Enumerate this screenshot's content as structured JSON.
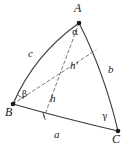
{
  "figure": {
    "name": "spherical-triangle",
    "stroke_color": "#3c3c3c",
    "dash_color": "#6b6b6b",
    "background": "#ffffff"
  },
  "vertices": [
    {
      "id": "A",
      "label": "A",
      "x": 79,
      "y": 23,
      "label_x": 76,
      "label_y": 4
    },
    {
      "id": "B",
      "label": "B",
      "x": 13,
      "y": 104,
      "label_x": 7,
      "label_y": 107
    },
    {
      "id": "C",
      "label": "C",
      "x": 118,
      "y": 131,
      "label_x": 114,
      "label_y": 134
    }
  ],
  "angles": [
    {
      "id": "alpha",
      "label": "α",
      "at": "A",
      "x": 74,
      "y": 30
    },
    {
      "id": "beta",
      "label": "β",
      "at": "B",
      "x": 22,
      "y": 92
    },
    {
      "id": "gamma",
      "label": "γ",
      "at": "C",
      "x": 104,
      "y": 114
    }
  ],
  "sides": [
    {
      "id": "a",
      "label": "a",
      "opposite": "A",
      "from": "B",
      "to": "C",
      "x": 57,
      "y": 131
    },
    {
      "id": "b",
      "label": "b",
      "opposite": "B",
      "from": "A",
      "to": "C",
      "x": 111,
      "y": 69
    },
    {
      "id": "c",
      "label": "c",
      "opposite": "C",
      "from": "B",
      "to": "A",
      "x": 31,
      "y": 52
    }
  ],
  "altitudes": [
    {
      "id": "h",
      "label": "h",
      "from": "A",
      "foot_x": 44,
      "foot_y": 117,
      "x": 52,
      "y": 97
    },
    {
      "id": "h-prime",
      "label": "h",
      "prime": "′",
      "from": "B",
      "foot_x": 96,
      "foot_y": 50,
      "x": 74,
      "y": 64
    }
  ],
  "paths": {
    "arc_c": "M 13 104 Q 34 55 79 23",
    "arc_b": "M 79 23 Q 104 72 118 131",
    "arc_a": "M 13 104 Q 62 118 118 131",
    "alt_h": "M 79 23 L 44 117",
    "alt_hprime": "M 13 104 L 96 50"
  },
  "marks": {
    "right_angle_beta": "M 19 96 L 22 98",
    "foot_tick_h": "M 43 113 L 45 120"
  }
}
